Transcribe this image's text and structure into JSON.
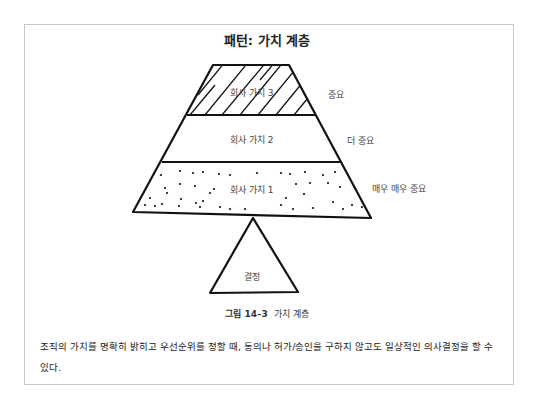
{
  "diagram": {
    "title": "패턴: 가치 계층",
    "layers": [
      {
        "label": "회사 가치 3",
        "importance": "중요",
        "fill": "hatched"
      },
      {
        "label": "회사 가치 2",
        "importance": "더 중요",
        "fill": "blank"
      },
      {
        "label": "회사 가치 1",
        "importance": "매우 매우 중요",
        "fill": "dotted"
      }
    ],
    "base": {
      "label": "결정"
    },
    "caption": {
      "number": "그림 14–3",
      "text": "가치 계층"
    }
  },
  "description": "조직의 가치를 명확히 밝히고 우선순위를 정할 때, 동의나 허가/승인을 구하지 않고도 일상적인 의사결정을 할 수 있다."
}
